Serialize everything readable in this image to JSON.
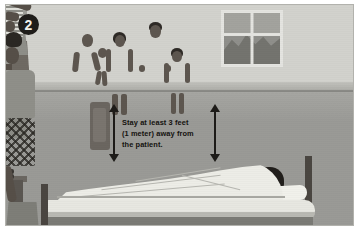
{
  "illustration": {
    "step_badge": "2",
    "caption": {
      "line1": "Stay at least 3 feet",
      "line2": "(1 meter) away from",
      "line3": "the patient."
    },
    "scene_title": "Caregiver keeping family members at a safe distance from a patient in bed",
    "elements": {
      "caregiver": "caregiver-standing-arm-raised",
      "patient": "patient-lying-in-bed",
      "family_group": "family-members-standing-back",
      "window": "window-with-hills-view",
      "distance_arrows": "safe-distance-arrows"
    },
    "people": [
      {
        "name": "woman-with-headwrap-holding-baby"
      },
      {
        "name": "baby-carried"
      },
      {
        "name": "woman-in-tank-top-and-skirt"
      },
      {
        "name": "man-in-shirt-and-trousers"
      },
      {
        "name": "girl-in-striped-dress"
      },
      {
        "name": "caregiver-in-patterned-dress"
      },
      {
        "name": "patient-under-blanket"
      }
    ],
    "colors": {
      "wall": "#c9c9c4",
      "wall_panel": "#d2d2cd",
      "floor": "#9a9a96",
      "blanket": "#edede7",
      "badge_background": "#1f1d1a",
      "badge_text": "#f2f2ec",
      "caption_text": "#14120f",
      "arrow": "#1d1b18"
    }
  }
}
